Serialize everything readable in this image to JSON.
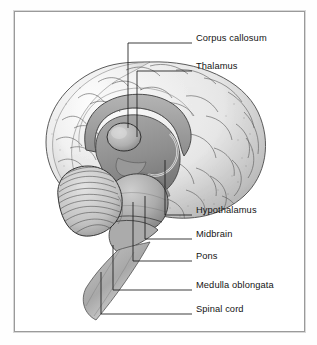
{
  "figure": {
    "kind": "anatomical-diagram",
    "frame_color": "#9a9a9a",
    "background_color": "#ffffff",
    "ink_color": "#1b1b1b",
    "style": "grayscale pen-and-ink medical illustration with stipple shading"
  },
  "labels": [
    {
      "id": "corpus-callosum",
      "text": "Corpus callosum",
      "x": 196,
      "y": 39,
      "leader_y": 43,
      "dash_x1": 170,
      "dash_x2": 192,
      "drop_x": 128,
      "drop_y": 128
    },
    {
      "id": "thalamus",
      "text": "Thalamus",
      "x": 196,
      "y": 67,
      "leader_y": 71,
      "dash_x1": 170,
      "dash_x2": 192,
      "drop_x": 137,
      "drop_y": 137
    },
    {
      "id": "hypothalamus",
      "text": "Hypothalamus",
      "x": 196,
      "y": 211,
      "leader_y": 215,
      "dash_x1": 170,
      "dash_x2": 192,
      "drop_x": 165,
      "drop_y": 160
    },
    {
      "id": "midbrain",
      "text": "Midbrain",
      "x": 196,
      "y": 235,
      "leader_y": 239,
      "dash_x1": 170,
      "dash_x2": 192,
      "drop_x": 145,
      "drop_y": 196
    },
    {
      "id": "pons",
      "text": "Pons",
      "x": 196,
      "y": 257,
      "leader_y": 261,
      "dash_x1": 170,
      "dash_x2": 192,
      "drop_x": 133,
      "drop_y": 202
    },
    {
      "id": "medulla-oblongata",
      "text": "Medulla oblongata",
      "x": 196,
      "y": 286,
      "leader_y": 290,
      "dash_x1": 170,
      "dash_x2": 192,
      "drop_x": 113,
      "drop_y": 245
    },
    {
      "id": "spinal-cord",
      "text": "Spinal cord",
      "x": 196,
      "y": 310,
      "leader_y": 314,
      "dash_x1": 170,
      "dash_x2": 192,
      "drop_x": 101,
      "drop_y": 272
    }
  ],
  "structures": [
    {
      "id": "cerebrum",
      "name": "Cerebral cortex"
    },
    {
      "id": "corpus-callosum",
      "name": "Corpus callosum"
    },
    {
      "id": "thalamus",
      "name": "Thalamus"
    },
    {
      "id": "hypothalamus",
      "name": "Hypothalamus"
    },
    {
      "id": "midbrain",
      "name": "Midbrain"
    },
    {
      "id": "pons",
      "name": "Pons"
    },
    {
      "id": "cerebellum",
      "name": "Cerebellum"
    },
    {
      "id": "medulla-oblongata",
      "name": "Medulla oblongata"
    },
    {
      "id": "spinal-cord",
      "name": "Spinal cord"
    }
  ]
}
